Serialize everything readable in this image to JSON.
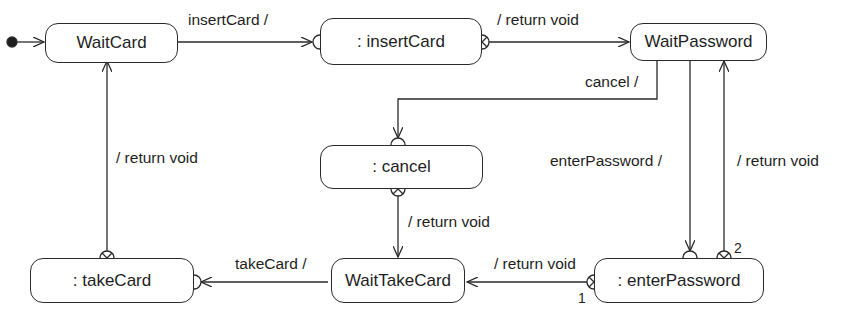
{
  "diagram": {
    "type": "UML protocol state machine",
    "colors": {
      "line": "#2a2a2a",
      "background": "#ffffff",
      "text": "#1e1e1e"
    },
    "states": {
      "wait_card": ": WaitCard",
      "insert_card": ": insertCard",
      "wait_password": "WaitPassword",
      "cancel": ": cancel",
      "take_card": ": takeCard",
      "wait_take_card": "WaitTakeCard",
      "enter_password": ": enterPassword"
    },
    "transitions": {
      "insert_card": "insertCard /",
      "return_void_1": "/ return void",
      "cancel": "cancel /",
      "return_void_cancel": "/ return void",
      "enter_password": "enterPassword /",
      "return_void_wp": "/ return void",
      "take_card": "takeCard /",
      "return_void_wtc": "/ return void",
      "return_void_tc": "/ return void"
    },
    "exit_point_labels": {
      "one": "1",
      "two": "2"
    }
  }
}
